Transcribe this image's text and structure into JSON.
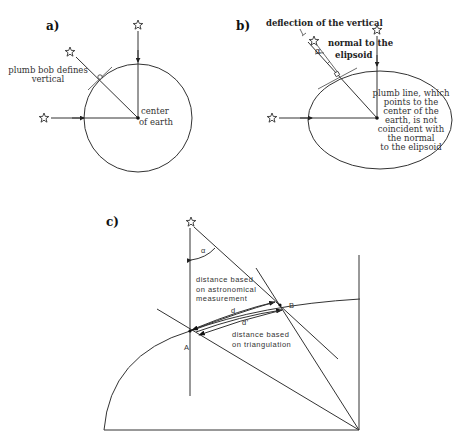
{
  "panels": {
    "a": {
      "label": "a)",
      "plumb_text_1": "plumb bob defines",
      "plumb_text_2": "vertical",
      "center_text_1": "center",
      "center_text_2": "of earth"
    },
    "b": {
      "label": "b)",
      "deflection_text": "deflection of the vertical",
      "alpha": "α",
      "normal_text_1": "normal to the",
      "normal_text_2": "elipsoid",
      "plumb_lines": [
        "plumb line, which",
        "points to the",
        "center of the",
        "earth, is not",
        "coincident with",
        "the normal",
        "to the elipsoid"
      ]
    },
    "c": {
      "label": "c)",
      "alpha": "α",
      "astro_lines": [
        "distance  based",
        "on  astronomical",
        "measurement"
      ],
      "d": "d",
      "d_prime": "d'",
      "tri_lines": [
        "distance  based",
        "on  triangulation"
      ],
      "point_a": "A",
      "point_b": "B"
    }
  },
  "icons": [
    "star-icon",
    "arrow-icon",
    "right-angle-marker-icon"
  ]
}
